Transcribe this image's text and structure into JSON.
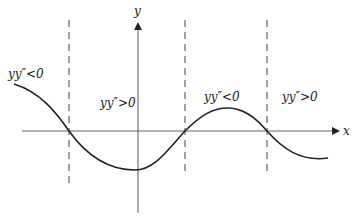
{
  "diagram": {
    "axes": {
      "x_label": "x",
      "y_label": "y"
    },
    "regions": [
      {
        "label": "yy″<0",
        "position": "left"
      },
      {
        "label": "yy″>0",
        "position": "center-left"
      },
      {
        "label": "yy″<0",
        "position": "center-right"
      },
      {
        "label": "yy″>0",
        "position": "right"
      }
    ],
    "colors": {
      "curve": "#222222",
      "axis": "#555555",
      "dashed": "#444444"
    }
  }
}
